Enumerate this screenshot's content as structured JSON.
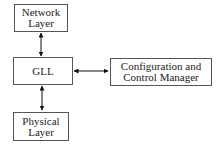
{
  "diagram": {
    "nodes": [
      {
        "id": "network",
        "lines": [
          "Network",
          "Layer"
        ]
      },
      {
        "id": "gll",
        "lines": [
          "GLL"
        ]
      },
      {
        "id": "physical",
        "lines": [
          "Physical",
          "Layer"
        ]
      },
      {
        "id": "config",
        "lines": [
          "Configuration and",
          "Control Manager"
        ]
      }
    ],
    "edges": [
      {
        "from": "network",
        "to": "gll",
        "direction": "bidirectional"
      },
      {
        "from": "gll",
        "to": "physical",
        "direction": "bidirectional"
      },
      {
        "from": "gll",
        "to": "config",
        "direction": "bidirectional"
      }
    ],
    "colors": {
      "stroke": "#555555",
      "arrow": "#111111",
      "background": "#ffffff"
    }
  }
}
